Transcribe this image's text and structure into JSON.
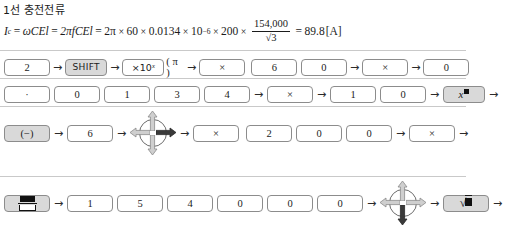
{
  "title": "1선 충전전류",
  "formula": {
    "lhs_symbol": "I",
    "lhs_sub": "c",
    "eq1": "=",
    "term1": "ωCEl",
    "eq2": "=",
    "term2": "2πfCEl",
    "eq3": "=",
    "term3_lead": "2π",
    "times": "×",
    "v_freq": "60",
    "v_cap": "0.0134",
    "v_pow_base": "10",
    "v_pow_exp": "−6",
    "v_len": "200",
    "frac_numerator": "154,000",
    "frac_denominator": "√3",
    "eq4": "=",
    "result": "89.8",
    "unit": "[A]"
  },
  "arrow": "→",
  "rows": [
    {
      "name": "row-1",
      "keys": [
        {
          "label": "2",
          "style": "plain",
          "arrow_after": true
        },
        {
          "label": "SHIFT",
          "style": "shaded-sans",
          "arrow_after": true
        },
        {
          "label": "×10ˣ",
          "style": "x10",
          "paren": "( π )",
          "arrow_after": true
        },
        {
          "label": "×",
          "style": "plain",
          "arrow_after": true
        },
        {
          "label": "6",
          "style": "plain",
          "arrow_after": false
        },
        {
          "label": "0",
          "style": "plain",
          "arrow_after": true
        },
        {
          "label": "×",
          "style": "plain",
          "arrow_after": true
        },
        {
          "label": "0",
          "style": "plain",
          "arrow_after": false
        }
      ]
    },
    {
      "name": "row-2",
      "keys": [
        {
          "label": "·",
          "style": "plain",
          "arrow_after": false
        },
        {
          "label": "0",
          "style": "plain",
          "arrow_after": false
        },
        {
          "label": "1",
          "style": "plain",
          "arrow_after": false
        },
        {
          "label": "3",
          "style": "plain",
          "arrow_after": false
        },
        {
          "label": "4",
          "style": "plain",
          "arrow_after": true
        },
        {
          "label": "×",
          "style": "plain",
          "arrow_after": true
        },
        {
          "label": "1",
          "style": "plain",
          "arrow_after": false
        },
        {
          "label": "0",
          "style": "plain",
          "arrow_after": true
        },
        {
          "label": "x■",
          "style": "shaded-xbox",
          "arrow_after": true
        }
      ]
    },
    {
      "name": "row-3",
      "keys": [
        {
          "label": "(−)",
          "style": "shaded",
          "arrow_after": true
        },
        {
          "label": "6",
          "style": "plain",
          "arrow_after": true
        },
        {
          "label": "dpad-right",
          "style": "dpad",
          "arrow_after": true
        },
        {
          "label": "×",
          "style": "plain",
          "arrow_after": true
        },
        {
          "label": "2",
          "style": "plain",
          "arrow_after": false
        },
        {
          "label": "0",
          "style": "plain",
          "arrow_after": false
        },
        {
          "label": "0",
          "style": "plain",
          "arrow_after": true
        },
        {
          "label": "×",
          "style": "plain",
          "arrow_after": true
        }
      ]
    },
    {
      "name": "row-4",
      "keys": [
        {
          "label": "fraction",
          "style": "shaded-frac",
          "arrow_after": true
        },
        {
          "label": "1",
          "style": "plain",
          "arrow_after": false
        },
        {
          "label": "5",
          "style": "plain",
          "arrow_after": false
        },
        {
          "label": "4",
          "style": "plain",
          "arrow_after": false
        },
        {
          "label": "0",
          "style": "plain",
          "arrow_after": false
        },
        {
          "label": "0",
          "style": "plain",
          "arrow_after": false
        },
        {
          "label": "0",
          "style": "plain",
          "arrow_after": true
        },
        {
          "label": "dpad-down",
          "style": "dpad",
          "arrow_after": true
        },
        {
          "label": "√■",
          "style": "shaded-sqrt",
          "arrow_after": true
        }
      ]
    }
  ],
  "colors": {
    "key_border": "#8c8c8c",
    "key_shaded_fill": "#d9d9d9",
    "dpad_arrow_light": "#cfcfcf",
    "dpad_arrow_dark": "#3a3a3a",
    "rule": "#c9c9c9",
    "text": "#1b1b1b"
  }
}
